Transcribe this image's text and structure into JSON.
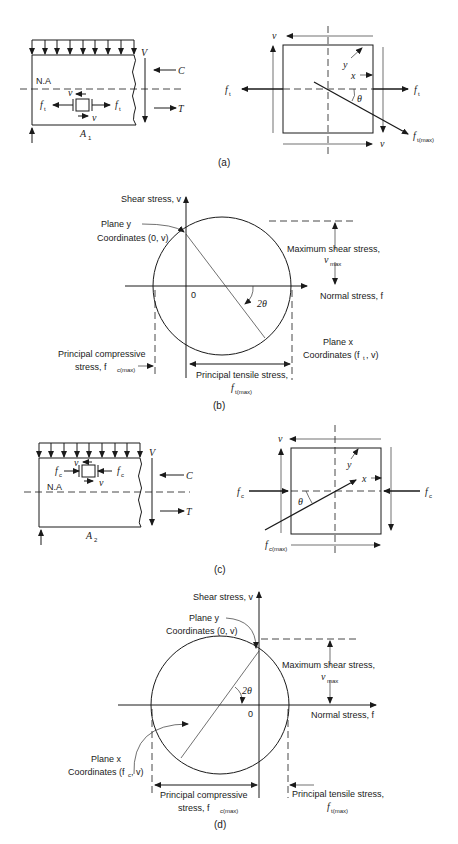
{
  "figure": {
    "panels": [
      {
        "id": "a",
        "caption": "(a)",
        "beam": {
          "neutral_axis_label": "N.A",
          "section_label": "A",
          "section_subscript": "1",
          "shear_label": "V",
          "compression_label": "C",
          "tension_label": "T",
          "element_stress_label": "f",
          "element_stress_subscript": "t",
          "element_shear_label": "v"
        },
        "element": {
          "shear_label": "v",
          "plane_y_label": "y",
          "plane_x_label": "x",
          "angle_label": "θ",
          "stress_label": "f",
          "stress_subscript": "t",
          "max_stress_label": "f",
          "max_stress_subscript": "t(max)"
        }
      },
      {
        "id": "b",
        "caption": "(b)",
        "mohr_circle": {
          "y_axis_label": "Shear stress, v",
          "x_axis_label": "Normal stress, f",
          "origin_label": "0",
          "plane_y_label": "Plane y",
          "plane_y_coords": "Coordinates (0, v)",
          "max_shear_label": "Maximum shear stress,",
          "max_shear_symbol": "v",
          "max_shear_subscript": "max",
          "angle_label": "2θ",
          "plane_x_label": "Plane x",
          "plane_x_coords_prefix": "Coordinates (f",
          "plane_x_coords_sub": "t",
          "plane_x_coords_suffix": ", v)",
          "compressive_label_line1": "Principal compressive",
          "compressive_label_line2": "stress, f",
          "compressive_subscript": "c(max)",
          "tensile_label_line1": "Principal tensile stress,",
          "tensile_symbol": "f",
          "tensile_subscript": "t(max)"
        }
      },
      {
        "id": "c",
        "caption": "(c)",
        "beam": {
          "neutral_axis_label": "N.A",
          "section_label": "A",
          "section_subscript": "2",
          "shear_label": "V",
          "compression_label": "C",
          "tension_label": "T",
          "element_stress_label": "f",
          "element_stress_subscript": "c",
          "element_shear_label": "v"
        },
        "element": {
          "shear_label": "v",
          "plane_y_label": "y",
          "plane_x_label": "x",
          "angle_label": "θ",
          "stress_label": "f",
          "stress_subscript": "c",
          "max_stress_label": "f",
          "max_stress_subscript": "c(max)"
        }
      },
      {
        "id": "d",
        "caption": "(d)",
        "mohr_circle": {
          "y_axis_label": "Shear stress, v",
          "x_axis_label": "Normal stress, f",
          "origin_label": "0",
          "plane_y_label": "Plane y",
          "plane_y_coords": "Coordinates (0, v)",
          "max_shear_label": "Maximum shear stress,",
          "max_shear_symbol": "v",
          "max_shear_subscript": "max",
          "angle_label": "2θ",
          "plane_x_label": "Plane x",
          "plane_x_coords_prefix": "Coordinates (f",
          "plane_x_coords_sub": "c",
          "plane_x_coords_suffix": ", v)",
          "compressive_label_line1": "Principal compressive",
          "compressive_label_line2": "stress, f",
          "compressive_subscript": "c(max)",
          "tensile_label_line1": "Principal tensile stress,",
          "tensile_symbol": "f",
          "tensile_subscript": "t(max)"
        }
      }
    ]
  }
}
